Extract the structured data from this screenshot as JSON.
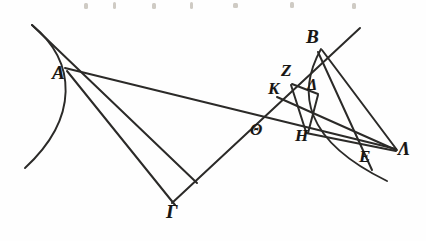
{
  "figure": {
    "background_color": "#fefefe",
    "ink_color": "#2b2a28",
    "width": 426,
    "height": 241,
    "points": [
      {
        "id": "A",
        "label": "A",
        "x": 197,
        "y": 183,
        "label_x": 52,
        "label_y": 63,
        "font_size": 19
      },
      {
        "id": "B",
        "label": "B",
        "x": 320,
        "y": 48,
        "label_x": 306,
        "label_y": 27,
        "font_size": 19
      },
      {
        "id": "Gamma",
        "label": "Γ",
        "x": 175,
        "y": 205,
        "label_x": 166,
        "label_y": 202,
        "font_size": 19
      },
      {
        "id": "Delta",
        "label": "Δ",
        "x": 317,
        "y": 93,
        "label_x": 307,
        "label_y": 77,
        "font_size": 16
      },
      {
        "id": "E",
        "label": "E",
        "x": 358,
        "y": 158,
        "label_x": 359,
        "label_y": 148,
        "font_size": 17
      },
      {
        "id": "Z",
        "label": "Z",
        "x": 293,
        "y": 82,
        "label_x": 281,
        "label_y": 62,
        "font_size": 17
      },
      {
        "id": "H",
        "label": "H",
        "x": 305,
        "y": 131,
        "label_x": 295,
        "label_y": 127,
        "font_size": 17
      },
      {
        "id": "Theta",
        "label": "Θ",
        "x": 252,
        "y": 120,
        "label_x": 250,
        "label_y": 122,
        "font_size": 16
      },
      {
        "id": "K",
        "label": "K",
        "x": 278,
        "y": 95,
        "label_x": 268,
        "label_y": 80,
        "font_size": 17
      },
      {
        "id": "Lambda",
        "label": "Λ",
        "x": 395,
        "y": 148,
        "label_x": 398,
        "label_y": 140,
        "font_size": 18
      }
    ],
    "segments": [
      {
        "name": "segment-upper-left-ray-through-A",
        "d": "M 32 25 L 197 183"
      },
      {
        "name": "segment-A-to-Lambda",
        "d": "M 65 68 L 396 149"
      },
      {
        "name": "segment-A-to-Gamma",
        "d": "M 67 71 L 175 205"
      },
      {
        "name": "segment-Gamma-to-B-through-Theta",
        "d": "M 172 203 L 360 28"
      },
      {
        "name": "segment-B-to-Lambda",
        "d": "M 322 50 L 397 150"
      },
      {
        "name": "segment-B-to-E-continued",
        "d": "M 318 52 L 372 170"
      },
      {
        "name": "segment-K-to-Lambda-through-E",
        "d": "M 277 97 L 396 150"
      },
      {
        "name": "segment-Z-to-Delta",
        "d": "M 292 84 L 318 94"
      },
      {
        "name": "segment-Z-to-H",
        "d": "M 291 85 L 306 132"
      },
      {
        "name": "segment-Delta-to-H-region",
        "d": "M 318 95 L 308 133"
      },
      {
        "name": "segment-H-to-Lambda",
        "d": "M 306 133 L 396 151"
      }
    ],
    "arcs": [
      {
        "name": "arc-left-through-A",
        "d": "M 32 25 C 77 62, 79 118, 25 168"
      },
      {
        "name": "arc-right-through-B",
        "d": "M 321 49 C 297 92, 303 140, 387 181"
      }
    ],
    "specks": [
      {
        "x": 84,
        "y": 3,
        "w": 4,
        "h": 6
      },
      {
        "x": 113,
        "y": 2,
        "w": 3,
        "h": 7
      },
      {
        "x": 152,
        "y": 3,
        "w": 4,
        "h": 6
      },
      {
        "x": 190,
        "y": 2,
        "w": 3,
        "h": 7
      },
      {
        "x": 233,
        "y": 3,
        "w": 5,
        "h": 5
      },
      {
        "x": 290,
        "y": 2,
        "w": 4,
        "h": 6
      },
      {
        "x": 352,
        "y": 3,
        "w": 4,
        "h": 6
      }
    ]
  }
}
